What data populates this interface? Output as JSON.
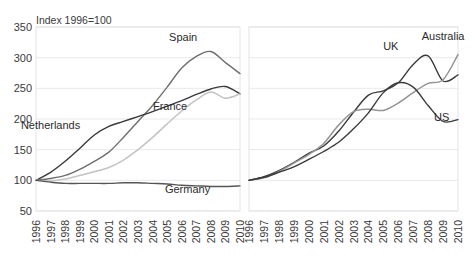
{
  "chart_data": {
    "type": "line",
    "title": "Index 1996=100",
    "xlabel": "",
    "ylabel": "",
    "ylim": [
      50,
      350
    ],
    "yticks": [
      50,
      100,
      150,
      200,
      250,
      300,
      350
    ],
    "grid": true,
    "legend": "inline-series-labels",
    "panels": [
      {
        "name": "left-panel",
        "x": [
          1996,
          1997,
          1998,
          1999,
          2000,
          2001,
          2002,
          2003,
          2004,
          2005,
          2006,
          2007,
          2008,
          2009,
          2010
        ],
        "xticklabels": [
          "1996",
          "1997",
          "1998",
          "1999",
          "2000",
          "2001",
          "2002",
          "2003",
          "2004",
          "2005",
          "2006",
          "2007",
          "2008",
          "2009",
          "2010"
        ],
        "series": [
          {
            "name": "Spain",
            "color": "#6e6e6e",
            "label_x": 2006.1,
            "label_y": 327,
            "values": [
              100,
              103,
              108,
              118,
              131,
              146,
              170,
              196,
              222,
              252,
              283,
              302,
              310,
              292,
              274
            ]
          },
          {
            "name": "Netherlands",
            "color": "#3a3a3a",
            "label_x": 1997.0,
            "label_y": 183,
            "values": [
              100,
              113,
              131,
              152,
              174,
              188,
              196,
              204,
              212,
              221,
              230,
              240,
              249,
              253,
              241
            ]
          },
          {
            "name": "France",
            "color": "#c3c3c3",
            "label_x": 2005.2,
            "label_y": 214,
            "values": [
              100,
              99,
              102,
              108,
              114,
              121,
              133,
              150,
              170,
              192,
              213,
              231,
              244,
              234,
              241
            ]
          },
          {
            "name": "Germany",
            "color": "#555555",
            "label_x": 2006.4,
            "label_y": 79,
            "values": [
              100,
              97,
              95,
              95,
              95,
              95,
              96,
              96,
              95,
              94,
              92,
              91,
              90,
              90,
              91
            ]
          }
        ]
      },
      {
        "name": "right-panel",
        "x": [
          1996,
          1997,
          1998,
          1999,
          2000,
          2001,
          2002,
          2003,
          2004,
          2005,
          2006,
          2007,
          2008,
          2009,
          2010
        ],
        "xticklabels": [
          "1996",
          "1997",
          "1998",
          "1999",
          "2000",
          "2001",
          "2002",
          "2003",
          "2004",
          "2005",
          "2006",
          "2007",
          "2008",
          "2009",
          "2010"
        ],
        "series": [
          {
            "name": "UK",
            "color": "#3a3a3a",
            "label_x": 2005.5,
            "label_y": 312,
            "values": [
              100,
              106,
              116,
              129,
              144,
              156,
              180,
              211,
              239,
              246,
              259,
              289,
              303,
              262,
              272
            ]
          },
          {
            "name": "Australia",
            "color": "#949494",
            "label_x": 2009.0,
            "label_y": 328,
            "values": [
              100,
              104,
              114,
              128,
              142,
              160,
              190,
              212,
              216,
              214,
              226,
              243,
              258,
              264,
              305
            ]
          },
          {
            "name": "US",
            "color": "#3a3a3a",
            "label_x": 2008.9,
            "label_y": 196,
            "values": [
              100,
              105,
              113,
              122,
              134,
              147,
              162,
              184,
              210,
              243,
              259,
              252,
              222,
              196,
              199
            ]
          }
        ]
      }
    ]
  }
}
